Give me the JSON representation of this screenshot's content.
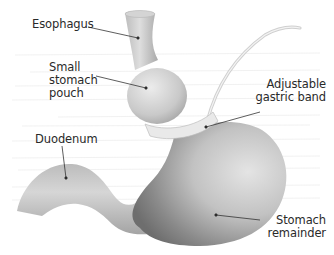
{
  "diagram": {
    "labels": {
      "esophagus": "Esophagus",
      "pouch": [
        "Small",
        "stomach",
        "pouch"
      ],
      "band": [
        "Adjustable",
        "gastric band"
      ],
      "duodenum": "Duodenum",
      "remainder": [
        "Stomach",
        "remainder"
      ]
    },
    "colors": {
      "organ_light": "#e6e6e6",
      "organ_mid": "#bdbdbd",
      "organ_dark": "#7a7a7a",
      "band": "#e9e9e9",
      "leader_line": "#333333",
      "text": "#2a2a2a"
    }
  }
}
